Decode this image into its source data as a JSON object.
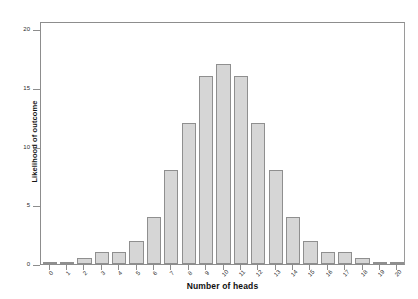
{
  "chart_data": {
    "type": "bar",
    "title": "",
    "xlabel": "Number of heads",
    "ylabel": "Likelihood of outcome",
    "categories": [
      "0",
      "1",
      "2",
      "3",
      "4",
      "5",
      "6",
      "7",
      "8",
      "9",
      "10",
      "11",
      "12",
      "13",
      "14",
      "15",
      "16",
      "17",
      "18",
      "19",
      "20"
    ],
    "values": [
      0.05,
      0.2,
      0.5,
      1,
      1,
      2,
      4,
      8,
      12,
      16,
      17,
      16,
      12,
      8,
      4,
      2,
      1,
      1,
      0.5,
      0.2,
      0.05
    ],
    "xlim": [
      -0.5,
      20.5
    ],
    "ylim": [
      0,
      20.7
    ],
    "yticks": [
      0,
      5,
      10,
      15,
      20
    ],
    "ytick_labels": [
      "0",
      "5",
      "10",
      "15",
      "20"
    ],
    "xticks": [
      0,
      1,
      2,
      3,
      4,
      5,
      6,
      7,
      8,
      9,
      10,
      11,
      12,
      13,
      14,
      15,
      16,
      17,
      18,
      19,
      20
    ],
    "grid": false,
    "legend": null,
    "bar_color": "#d6d6d6",
    "bar_edge_color": "#8f8f8f",
    "axis_color": "#8d8d8d",
    "background_color": "#ffffff"
  },
  "axis_labels": {
    "x_title": "Number of heads",
    "y_title": "Likelihood of outcome"
  }
}
